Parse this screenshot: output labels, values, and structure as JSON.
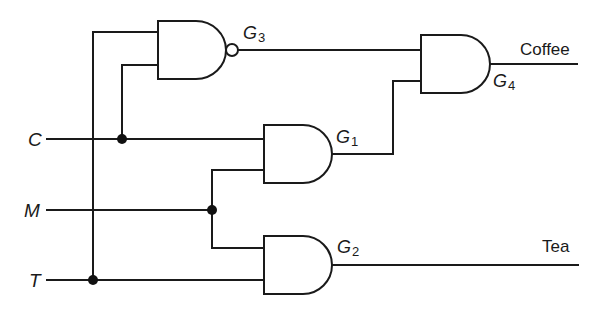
{
  "diagram": {
    "type": "logic-circuit",
    "inputs": [
      {
        "id": "C",
        "label": "C"
      },
      {
        "id": "M",
        "label": "M"
      },
      {
        "id": "T",
        "label": "T"
      }
    ],
    "gates": [
      {
        "id": "G1",
        "label": "G",
        "index": "1",
        "type": "AND",
        "inputs": [
          "C",
          "M"
        ]
      },
      {
        "id": "G2",
        "label": "G",
        "index": "2",
        "type": "AND",
        "inputs": [
          "M",
          "T"
        ]
      },
      {
        "id": "G3",
        "label": "G",
        "index": "3",
        "type": "NAND",
        "inputs": [
          "T",
          "C"
        ]
      },
      {
        "id": "G4",
        "label": "G",
        "index": "4",
        "type": "AND",
        "inputs": [
          "G3",
          "G1"
        ]
      }
    ],
    "outputs": [
      {
        "id": "coffee",
        "label": "Coffee",
        "source": "G4"
      },
      {
        "id": "tea",
        "label": "Tea",
        "source": "G2"
      }
    ],
    "colors": {
      "line": "#1a1a1a",
      "background": "#ffffff"
    }
  }
}
